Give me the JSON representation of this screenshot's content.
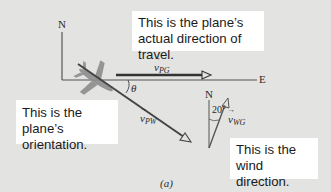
{
  "figure": {
    "caption": "(a)",
    "colors": {
      "background": "#e3e3e2",
      "callout_bg": "#ffffff",
      "axis_line": "#555555",
      "vector_line": "#404040",
      "plane": "#8a8a8a"
    }
  },
  "axes": {
    "north_label": "N",
    "east_label": "E"
  },
  "vectors": {
    "v_pg": {
      "symbol": "v",
      "subscript": "PG",
      "arrow": "→"
    },
    "v_pw": {
      "symbol": "v",
      "subscript": "PW",
      "arrow": "→"
    },
    "v_wg": {
      "symbol": "v",
      "subscript": "WG",
      "arrow": "→"
    }
  },
  "angles": {
    "theta": "θ",
    "wind_angle": "20°"
  },
  "wind_axis": {
    "north_label": "N"
  },
  "callouts": {
    "actual_direction": "This is the plane’s actual direction of travel.",
    "orientation": "This is the plane’s orientation.",
    "wind_direction": "This is the wind direction."
  }
}
